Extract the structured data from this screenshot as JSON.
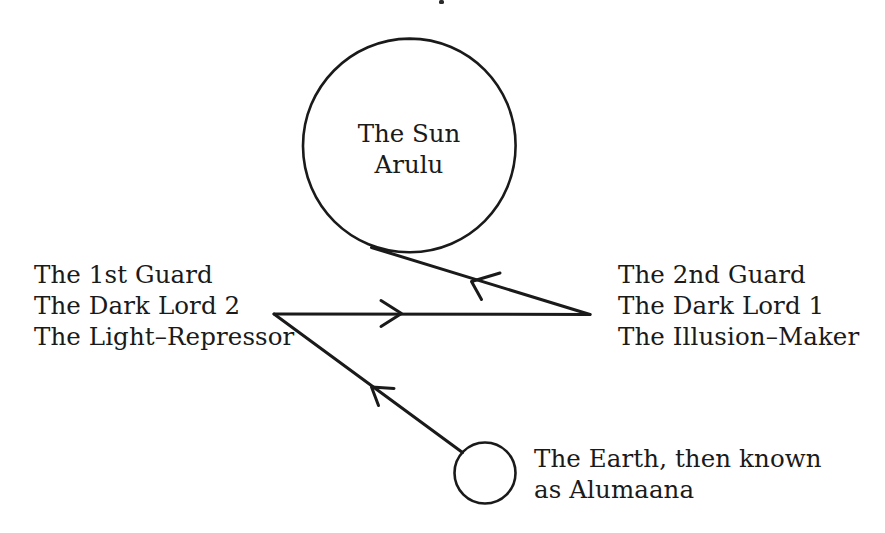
{
  "canvas": {
    "width": 885,
    "height": 533,
    "background": "#ffffff",
    "ink": "#1a1a1a"
  },
  "diagram": {
    "type": "node-link-diagram",
    "title_visible": false,
    "nodes": [
      {
        "id": "sun",
        "shape": "circle",
        "label_lines": [
          "The Sun",
          "Arulu"
        ],
        "label_position": "inside",
        "center": [
          409,
          145
        ],
        "radius": 107
      },
      {
        "id": "first-guard",
        "shape": "vertex",
        "label_lines": [
          "The 1st Guard",
          "The Dark Lord 2",
          "The Light–Repressor"
        ],
        "label_position": "left",
        "vertex": [
          274,
          314
        ]
      },
      {
        "id": "second-guard",
        "shape": "vertex",
        "label_lines": [
          "The 2nd Guard",
          "The Dark Lord 1",
          "The Illusion–Maker"
        ],
        "label_position": "right",
        "vertex": [
          590,
          314
        ]
      },
      {
        "id": "earth",
        "shape": "circle",
        "label_lines": [
          "The Earth, then known",
          "as Alumaana"
        ],
        "label_position": "right",
        "center": [
          485,
          473
        ],
        "radius": 30
      }
    ],
    "edges": [
      {
        "id": "sun-to-second-guard",
        "from": "sun",
        "to": "second-guard",
        "direction": "from-sun-down-right",
        "arrow_points_to": "sun",
        "arrowhead_style": "open-v"
      },
      {
        "id": "second-guard-to-first-guard",
        "from": "second-guard",
        "to": "first-guard",
        "direction": "horizontal",
        "arrow_points_to": "second-guard",
        "arrowhead_style": "open-v"
      },
      {
        "id": "earth-to-first-guard",
        "from": "earth",
        "to": "first-guard",
        "direction": "diagonal-up-left",
        "arrow_points_to": "first-guard",
        "arrowhead_style": "open-v"
      }
    ]
  },
  "labels": {
    "sun": {
      "line1": "The Sun",
      "line2": "Arulu"
    },
    "left_guard": {
      "line1": "The 1st Guard",
      "line2": "The Dark Lord 2",
      "line3": "The Light–Repressor"
    },
    "right_guard": {
      "line1": "The 2nd Guard",
      "line2": "The Dark Lord 1",
      "line3": "The Illusion–Maker"
    },
    "earth": {
      "line1": "The Earth, then known",
      "line2": "as Alumaana"
    }
  }
}
